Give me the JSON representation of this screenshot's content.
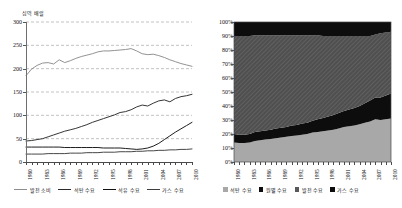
{
  "figure": {
    "panels": [
      "left",
      "right"
    ]
  },
  "left": {
    "unit_label": "십억 배럴",
    "yticks": [
      "0",
      "50",
      "100",
      "150",
      "200",
      "250",
      "300"
    ],
    "xticks": [
      "1980",
      "1981",
      "1982",
      "1983",
      "1984",
      "1985",
      "1986",
      "1987",
      "1988",
      "1989",
      "1990",
      "1991",
      "1992",
      "1993",
      "1994",
      "1995",
      "1996",
      "1997",
      "1998",
      "1999",
      "2000",
      "2001",
      "2002",
      "2003",
      "2004",
      "2005",
      "2006",
      "2007",
      "2008",
      "2009",
      "2010"
    ],
    "xlabels_shown": [
      "1980",
      "1983",
      "1986",
      "1989",
      "1992",
      "1995",
      "1998",
      "2001",
      "2004",
      "2007",
      "2010"
    ],
    "legend": [
      {
        "label": "발전 소비",
        "marker": "line",
        "color": "#8c8c8c"
      },
      {
        "label": "석탄 수요",
        "marker": "line",
        "color": "#2a2a2a"
      },
      {
        "label": "석유 수요",
        "marker": "line",
        "color": "#111111"
      },
      {
        "label": "가스 수요",
        "marker": "line",
        "color": "#3d3d3d"
      }
    ]
  },
  "right": {
    "yticks": [
      "0%",
      "10%",
      "20%",
      "30%",
      "40%",
      "50%",
      "60%",
      "70%",
      "80%",
      "90%",
      "100%"
    ],
    "xlabels_shown": [
      "1980",
      "1983",
      "1986",
      "1989",
      "1992",
      "1995",
      "1998",
      "2001",
      "2004",
      "2007",
      "2010"
    ],
    "legend": [
      {
        "label": "석탄 수요",
        "marker": "square",
        "color": "#a8a8a8"
      },
      {
        "label": "원별 수요",
        "marker": "square",
        "color": "#0d0d0d"
      },
      {
        "label": "발전 수요",
        "marker": "square",
        "color": "#595959"
      },
      {
        "label": "가스 수요",
        "marker": "square",
        "color": "#0d0d0d"
      }
    ]
  },
  "chart_data": [
    {
      "type": "line",
      "title": "",
      "subtitle": "",
      "xlabel": "",
      "ylabel": "십억 배럴",
      "ylim": [
        0,
        300
      ],
      "ytick_step": 50,
      "grid": true,
      "grid_style": "dashed-horizontal",
      "legend_position": "bottom",
      "x": [
        1980,
        1981,
        1982,
        1983,
        1984,
        1985,
        1986,
        1987,
        1988,
        1989,
        1990,
        1991,
        1992,
        1993,
        1994,
        1995,
        1996,
        1997,
        1998,
        1999,
        2000,
        2001,
        2002,
        2003,
        2004,
        2005,
        2006,
        2007,
        2008,
        2009,
        2010
      ],
      "series": [
        {
          "name": "발전 소비",
          "color": "#8c8c8c",
          "values": [
            185,
            199,
            207,
            212,
            213,
            210,
            219,
            213,
            217,
            222,
            226,
            229,
            232,
            236,
            238,
            238,
            239,
            240,
            241,
            243,
            238,
            232,
            230,
            231,
            228,
            224,
            219,
            215,
            211,
            208,
            205
          ]
        },
        {
          "name": "석탄 수요",
          "color": "#2a2a2a",
          "values": [
            45,
            46,
            48,
            50,
            54,
            58,
            62,
            66,
            69,
            72,
            76,
            80,
            85,
            89,
            93,
            97,
            101,
            106,
            108,
            112,
            118,
            122,
            120,
            126,
            131,
            133,
            129,
            136,
            140,
            142,
            145
          ]
        },
        {
          "name": "석유 수요",
          "color": "#111111",
          "values": [
            32,
            32,
            32,
            32,
            32,
            32,
            32,
            31,
            31,
            31,
            31,
            31,
            31,
            31,
            30,
            30,
            30,
            30,
            29,
            28,
            27,
            28,
            30,
            34,
            40,
            48,
            56,
            64,
            71,
            78,
            85
          ]
        },
        {
          "name": "가스 수요",
          "color": "#3d3d3d",
          "values": [
            17,
            17,
            17,
            17,
            18,
            18,
            18,
            18,
            19,
            19,
            19,
            20,
            20,
            20,
            21,
            21,
            21,
            22,
            22,
            22,
            23,
            23,
            24,
            24,
            25,
            25,
            26,
            26,
            27,
            27,
            28
          ]
        }
      ]
    },
    {
      "type": "area",
      "stacked": "100%",
      "title": "",
      "xlabel": "",
      "ylabel": "",
      "ylim": [
        0,
        100
      ],
      "ytick_step": 10,
      "grid": false,
      "legend_position": "bottom",
      "x": [
        1980,
        1981,
        1982,
        1983,
        1984,
        1985,
        1986,
        1987,
        1988,
        1989,
        1990,
        1991,
        1992,
        1993,
        1994,
        1995,
        1996,
        1997,
        1998,
        1999,
        2000,
        2001,
        2002,
        2003,
        2004,
        2005,
        2006,
        2007,
        2008,
        2009,
        2010
      ],
      "series": [
        {
          "name": "석탄 수요",
          "color": "#a8a8a8",
          "values": [
            14,
            13.5,
            13.5,
            14,
            15,
            15.5,
            16,
            16.5,
            17,
            17.5,
            18,
            18.5,
            19,
            19.5,
            20,
            21,
            21.5,
            22,
            22.5,
            23,
            24,
            25,
            25.5,
            26,
            27,
            28,
            29,
            30.5,
            30,
            30.5,
            31
          ]
        },
        {
          "name": "원별 수요",
          "color": "#0d0d0d",
          "values": [
            6,
            6,
            6,
            6,
            6.5,
            6.5,
            6.5,
            6.5,
            7,
            7,
            7,
            7.5,
            7.5,
            8,
            8,
            8.5,
            9,
            9.5,
            10,
            10.5,
            11,
            11.5,
            12,
            12.5,
            13,
            14,
            15,
            15.5,
            16,
            17,
            18
          ]
        },
        {
          "name": "발전 수요",
          "color": "#595959",
          "values": [
            70,
            70.5,
            70.5,
            70,
            69,
            68.5,
            68,
            67.5,
            66.5,
            66,
            65.5,
            64.5,
            64,
            63,
            62.5,
            61,
            60,
            58.5,
            57.5,
            56.5,
            55,
            53.5,
            52.5,
            51.5,
            50,
            48,
            46,
            45,
            46,
            45,
            44
          ]
        },
        {
          "name": "가스 수요",
          "color": "#0d0d0d",
          "values": [
            10,
            10,
            10,
            10,
            9.5,
            9.5,
            9.5,
            9.5,
            9.5,
            9.5,
            9.5,
            9.5,
            9.5,
            9.5,
            9.5,
            9.5,
            9.5,
            10,
            10,
            10,
            10,
            10,
            10,
            10,
            10,
            10,
            10,
            9,
            8,
            7.5,
            7
          ]
        }
      ]
    }
  ]
}
